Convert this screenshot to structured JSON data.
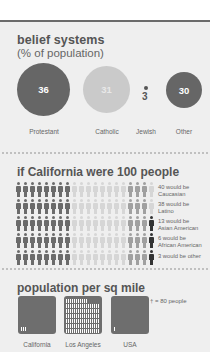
{
  "section1": {
    "title": "belief systems",
    "subtitle": "(% of population)",
    "items": [
      {
        "label": "Protestant",
        "value": "36",
        "color": "#666666"
      },
      {
        "label": "Catholic",
        "value": "31",
        "color": "#cacaca"
      },
      {
        "label": "Jewish",
        "value": "3",
        "color": "#555555"
      },
      {
        "label": "Other",
        "value": "30",
        "color": "#666666"
      }
    ]
  },
  "section2": {
    "title": "if California were 100 people",
    "legend": [
      {
        "line1": "40 would be",
        "line2": "Caucasian"
      },
      {
        "line1": "38 would be",
        "line2": "Latino"
      },
      {
        "line1": "13 would be",
        "line2": "Asian American"
      },
      {
        "line1": "6 would be",
        "line2": "African American"
      },
      {
        "line1": "3 would be other",
        "line2": ""
      }
    ],
    "colors": {
      "caucasian": "#6b6b6b",
      "latino": "#d6d6d6",
      "asian": "#a0a0a0",
      "african": "#a0a0a0",
      "other": "#333333"
    }
  },
  "section3": {
    "title": "population per sq mile",
    "key": "† = 80 people",
    "boxes": [
      {
        "label": "California",
        "icons": 3
      },
      {
        "label": "Los Angeles",
        "icons": 100
      },
      {
        "label": "USA",
        "icons": 1
      }
    ]
  },
  "chart_data": [
    {
      "type": "bubble",
      "title": "belief systems (% of population)",
      "categories": [
        "Protestant",
        "Catholic",
        "Jewish",
        "Other"
      ],
      "values": [
        36,
        31,
        3,
        30
      ],
      "unit": "% of population"
    },
    {
      "type": "pictogram",
      "title": "if California were 100 people",
      "categories": [
        "Caucasian",
        "Latino",
        "Asian American",
        "African American",
        "Other"
      ],
      "values": [
        40,
        38,
        13,
        6,
        3
      ],
      "grid": {
        "rows": 5,
        "cols": 20
      }
    },
    {
      "type": "pictogram",
      "title": "population per sq mile",
      "categories": [
        "California",
        "Los Angeles",
        "USA"
      ],
      "icon_unit": "1 icon = 80 people",
      "icons": [
        3,
        100,
        1
      ]
    }
  ]
}
